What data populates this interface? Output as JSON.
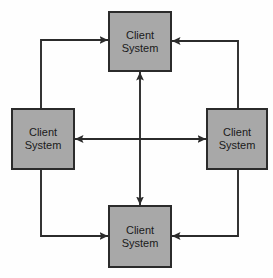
{
  "diagram": {
    "type": "network-topology",
    "background_color": "#fefefe",
    "node_fill_color": "#a8a8a8",
    "node_border_color": "#2b2b2b",
    "connector_color": "#2b2b2b",
    "nodes": [
      {
        "id": "top",
        "line1": "Client",
        "line2": "System",
        "x": 108,
        "y": 11,
        "width": 64,
        "height": 61
      },
      {
        "id": "left",
        "line1": "Client",
        "line2": "System",
        "x": 11,
        "y": 108,
        "width": 64,
        "height": 62
      },
      {
        "id": "right",
        "line1": "Client",
        "line2": "System",
        "x": 206,
        "y": 108,
        "width": 62,
        "height": 62
      },
      {
        "id": "bottom",
        "line1": "Client",
        "line2": "System",
        "x": 108,
        "y": 205,
        "width": 64,
        "height": 63
      }
    ],
    "connectors": [
      {
        "id": "top-left-elbow",
        "from": "left",
        "to": "top",
        "style": "elbow",
        "bidirectional": true,
        "corner_x": 41,
        "corner_y": 40
      },
      {
        "id": "top-right-elbow",
        "from": "right",
        "to": "top",
        "style": "elbow",
        "bidirectional": true,
        "corner_x": 238,
        "corner_y": 41
      },
      {
        "id": "bottom-left-elbow",
        "from": "left",
        "to": "bottom",
        "style": "elbow",
        "bidirectional": true,
        "corner_x": 41,
        "corner_y": 236
      },
      {
        "id": "bottom-right-elbow",
        "from": "right",
        "to": "bottom",
        "style": "elbow",
        "bidirectional": true,
        "corner_x": 238,
        "corner_y": 236
      },
      {
        "id": "horizontal-cross",
        "from": "left",
        "to": "right",
        "style": "straight",
        "bidirectional": true,
        "axis": "horizontal",
        "position": 139
      },
      {
        "id": "vertical-cross",
        "from": "top",
        "to": "bottom",
        "style": "straight",
        "bidirectional": true,
        "axis": "vertical",
        "position": 140
      }
    ]
  }
}
